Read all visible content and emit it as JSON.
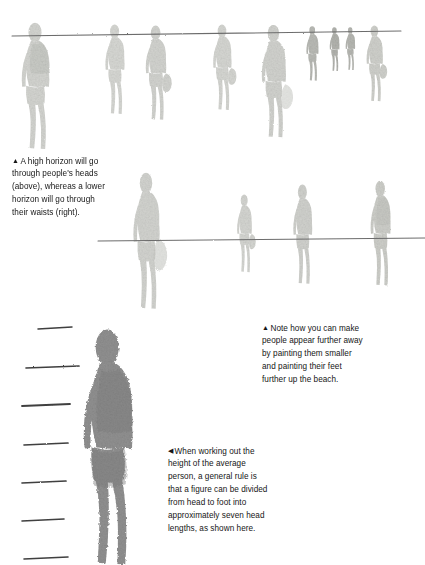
{
  "page": {
    "background_color": "#ffffff",
    "width": 425,
    "height": 565,
    "text_color": "#161616",
    "figure_light_color": "#d5d6d2",
    "figure_mid_color": "#c3c4bf",
    "figure_dark_color": "#8e8e8e",
    "horizon_line_color": "#6e6e6e",
    "tick_color": "#4a4a4a"
  },
  "captions": {
    "horizon": {
      "marker": "▲",
      "lines": [
        "A high horizon will go",
        "through people's heads",
        "(above), whereas a lower",
        "horizon will go through",
        "their waists (right)."
      ],
      "full_text": "▲ A high horizon will go through people's heads (above), whereas a lower horizon will go through their waists (right)."
    },
    "distance": {
      "marker": "▲",
      "lines": [
        "Note how you can make",
        "people appear further away",
        "by painting them smaller",
        "and painting their feet",
        "further up the beach."
      ],
      "full_text": "▲ Note how you can make people appear further away by painting them smaller and painting their feet further up the beach."
    },
    "heads": {
      "marker": "◀",
      "lines": [
        "When working out the",
        "height of the average",
        "person, a general rule is",
        "that a figure can be divided",
        "from head to foot into",
        "approximately seven head",
        "lengths, as shown here."
      ],
      "full_text": "◀ When working out the height of the average person, a general rule is that a figure can be divided from head to foot into approximately seven head lengths, as shown here."
    }
  },
  "illustrations": {
    "top_scene": {
      "name": "high-horizon-beach-scene",
      "horizon_line": {
        "x1": 12,
        "y1": 36,
        "x2": 401,
        "y2": 31
      },
      "figure_count": 9
    },
    "middle_scene": {
      "name": "low-horizon-beach-scene",
      "horizon_line": {
        "x1": 98,
        "y1": 241,
        "x2": 425,
        "y2": 238
      },
      "figure_count": 4
    },
    "bottom_scene": {
      "name": "seven-head-lengths-figure",
      "head_length_count": 7,
      "tick_marks_y": [
        328,
        367,
        405,
        444,
        482,
        520,
        558
      ]
    }
  }
}
